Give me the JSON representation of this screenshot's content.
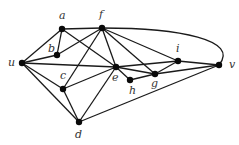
{
  "graph": {
    "vertices": [
      {
        "id": "a",
        "label": "a",
        "x": 62,
        "y": 29,
        "lx": 59,
        "ly": 19
      },
      {
        "id": "b",
        "label": "b",
        "x": 57,
        "y": 55,
        "lx": 48,
        "ly": 52
      },
      {
        "id": "f",
        "label": "f",
        "x": 102,
        "y": 28,
        "lx": 99,
        "ly": 18
      },
      {
        "id": "u",
        "label": "u",
        "x": 22,
        "y": 63,
        "lx": 8,
        "ly": 66
      },
      {
        "id": "c",
        "label": "c",
        "x": 63,
        "y": 89,
        "lx": 60,
        "ly": 79
      },
      {
        "id": "e",
        "label": "e",
        "x": 116,
        "y": 67,
        "lx": 112,
        "ly": 81
      },
      {
        "id": "h",
        "label": "h",
        "x": 130,
        "y": 80,
        "lx": 129,
        "ly": 94
      },
      {
        "id": "g",
        "label": "g",
        "x": 155,
        "y": 74,
        "lx": 151,
        "ly": 87
      },
      {
        "id": "i",
        "label": "i",
        "x": 178,
        "y": 61,
        "lx": 176,
        "ly": 52
      },
      {
        "id": "v",
        "label": "v",
        "x": 219,
        "y": 65,
        "lx": 229,
        "ly": 68
      },
      {
        "id": "d",
        "label": "d",
        "x": 79,
        "y": 122,
        "lx": 75,
        "ly": 138
      }
    ],
    "edges": [
      [
        "a",
        "f"
      ],
      [
        "a",
        "b"
      ],
      [
        "a",
        "u"
      ],
      [
        "a",
        "e"
      ],
      [
        "f",
        "b"
      ],
      [
        "f",
        "c"
      ],
      [
        "f",
        "e"
      ],
      [
        "f",
        "g"
      ],
      [
        "f",
        "i"
      ],
      [
        "u",
        "b"
      ],
      [
        "u",
        "e"
      ],
      [
        "u",
        "c"
      ],
      [
        "u",
        "d"
      ],
      [
        "c",
        "e"
      ],
      [
        "c",
        "d"
      ],
      [
        "e",
        "i"
      ],
      [
        "e",
        "g"
      ],
      [
        "e",
        "h"
      ],
      [
        "e",
        "d"
      ],
      [
        "h",
        "g"
      ],
      [
        "d",
        "v"
      ],
      [
        "g",
        "i"
      ],
      [
        "g",
        "v"
      ],
      [
        "i",
        "v"
      ]
    ],
    "curved_edges": [
      {
        "from": "f",
        "to": "v",
        "path": "M102,28 C180,28 240,40 219,65"
      }
    ]
  }
}
